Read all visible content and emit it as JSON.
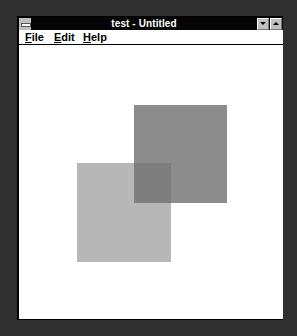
{
  "window": {
    "title": "test - Untitled",
    "controls": {
      "system_menu": "system-menu-icon",
      "minimize": "minimize-arrow-down-icon",
      "maximize": "maximize-arrow-up-icon"
    }
  },
  "menubar": {
    "items": [
      {
        "label_ul": "F",
        "label_rest": "ile"
      },
      {
        "label_ul": "E",
        "label_rest": "dit"
      },
      {
        "label_ul": "H",
        "label_rest": "elp"
      }
    ]
  },
  "canvas": {
    "shapes": [
      {
        "type": "rect",
        "name": "dark-square",
        "x": 115,
        "y": 60,
        "width": 93,
        "height": 98,
        "color": "#8c8c8c"
      },
      {
        "type": "rect",
        "name": "light-square",
        "x": 58,
        "y": 118,
        "width": 94,
        "height": 99,
        "color": "#aaaaaa",
        "opacity": 0.85
      }
    ],
    "overlap_color": "#7d7d7d",
    "background": "#ffffff"
  },
  "colors": {
    "desktop": "#2f2f2f",
    "titlebar": "#050505",
    "title_text": "#ffffff",
    "button_face": "#c0c0c0"
  }
}
